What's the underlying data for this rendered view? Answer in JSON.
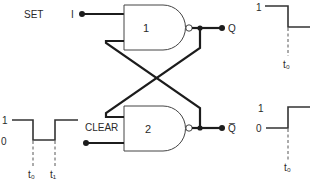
{
  "diagram": {
    "type": "SR latch (cross-coupled NAND gates) with timing waveforms",
    "inputs": {
      "set": {
        "label": "SET",
        "level_marker": "I"
      },
      "clear": {
        "label": "CLEAR"
      }
    },
    "gates": [
      {
        "id": "gate-1",
        "label": "1",
        "kind": "NAND"
      },
      {
        "id": "gate-2",
        "label": "2",
        "kind": "NAND"
      }
    ],
    "outputs": {
      "q": {
        "label": "Q"
      },
      "q_bar": {
        "label": "Q̅"
      }
    },
    "waveforms": {
      "clear_input": {
        "level_high": "1",
        "level_low": "0",
        "t0": "t₀",
        "t1": "t₁",
        "description": "high, goes low at t0, returns high at t1"
      },
      "q_output": {
        "level_high": "1",
        "t0": "t₀",
        "description": "high, goes low at t0"
      },
      "q_bar_output": {
        "level_high": "1",
        "level_low": "0",
        "t0": "t₀",
        "description": "low, goes high at t0"
      }
    }
  }
}
